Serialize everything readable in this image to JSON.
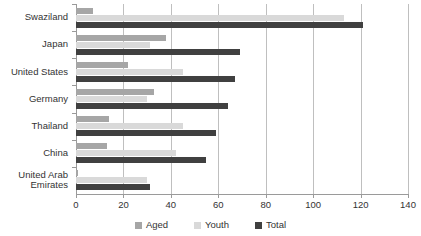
{
  "chart_data": {
    "type": "bar",
    "orientation": "horizontal",
    "title": "",
    "subtitle": "",
    "xlabel": "",
    "ylabel": "",
    "xlim": [
      0,
      140
    ],
    "xticks": [
      0,
      20,
      40,
      60,
      80,
      100,
      120,
      140
    ],
    "xtick_labels": [
      "0",
      "20",
      "40",
      "60",
      "80",
      "100",
      "120",
      "140"
    ],
    "grid": true,
    "grid_axis": "x",
    "legend_position": "bottom",
    "categories": [
      "Swaziland",
      "Japan",
      "United States",
      "Germany",
      "Thailand",
      "China",
      "United Arab\nEmirates"
    ],
    "series": [
      {
        "name": "Aged",
        "color": "#a6a6a6",
        "values": [
          7,
          38,
          22,
          33,
          14,
          13,
          1
        ]
      },
      {
        "name": "Youth",
        "color": "#d9d9d9",
        "values": [
          113,
          31,
          45,
          30,
          45,
          42,
          30
        ]
      },
      {
        "name": "Total",
        "color": "#404040",
        "values": [
          121,
          69,
          67,
          64,
          59,
          55,
          31
        ]
      }
    ]
  },
  "legend": {
    "items": [
      {
        "label": "Aged",
        "swatch": "aged"
      },
      {
        "label": "Youth",
        "swatch": "youth"
      },
      {
        "label": "Total",
        "swatch": "total"
      }
    ]
  },
  "colors": {
    "aged": "#a6a6a6",
    "youth": "#d9d9d9",
    "total": "#404040",
    "gridline": "#bfbfbf",
    "axis": "#9a9a9a",
    "background": "#ffffff",
    "text": "#333333"
  }
}
